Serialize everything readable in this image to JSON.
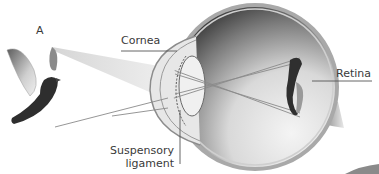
{
  "diagram": {
    "object_label": "A",
    "object_icon": "bird-icon",
    "labels": {
      "cornea": "Cornea",
      "retina": "Retina",
      "suspensory_line1": "Suspensory",
      "suspensory_line2": "ligament"
    },
    "colors": {
      "text": "#3a3a3a",
      "leader_line": "#555555",
      "ray": "#8a8a8a",
      "eye_shade_dark": "#4a4a4a",
      "eye_shade_light": "#f2f2f2",
      "sclera_rim": "#a9a9a9"
    }
  }
}
